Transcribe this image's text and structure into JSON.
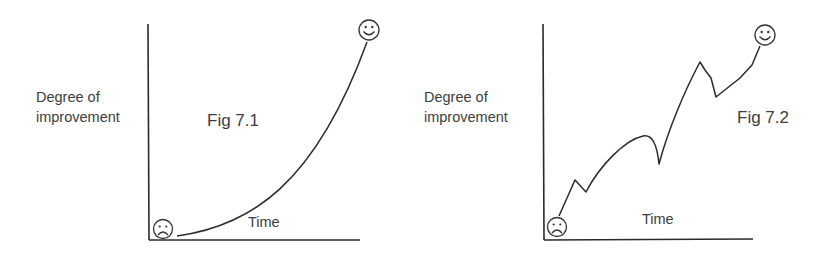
{
  "figures": [
    {
      "id": "fig-7-1",
      "title": "Fig 7.1",
      "y_label_line1": "Degree of",
      "y_label_line2": "improvement",
      "x_label": "Time",
      "start_icon": "sad-face",
      "end_icon": "happy-face",
      "curve": "smooth exponential-like rise"
    },
    {
      "id": "fig-7-2",
      "title": "Fig 7.2",
      "y_label_line1": "Degree of",
      "y_label_line2": "improvement",
      "x_label": "Time",
      "start_icon": "sad-face",
      "end_icon": "happy-face",
      "curve": "jagged rise with setbacks"
    }
  ],
  "colors": {
    "line": "#2a2a2a",
    "text": "#3d3d3d",
    "background": "#ffffff"
  }
}
